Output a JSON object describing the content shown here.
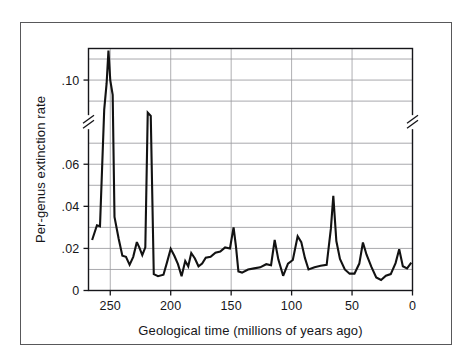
{
  "figure": {
    "background_color": "#ffffff",
    "frame_color": "#58585a",
    "line_color": "#121212",
    "grid_color": "#9a9a9e",
    "axis_color": "#16161a"
  },
  "chart_data": {
    "type": "line",
    "title": "",
    "subtitle": "",
    "xlabel": "Geological time (millions of years ago)",
    "ylabel": "Per-genus extinction rate",
    "xlim": [
      268,
      0
    ],
    "ylim": [
      0,
      0.115
    ],
    "x_reversed": true,
    "grid": true,
    "grid_axis": "y",
    "legend": "none",
    "xticks": [
      250,
      200,
      150,
      100,
      50,
      0
    ],
    "xtick_labels": [
      "250",
      "200",
      "150",
      "100",
      "50",
      "0"
    ],
    "yticks": [
      0,
      0.02,
      0.04,
      0.06,
      0.1
    ],
    "ytick_labels": [
      "0",
      ".02",
      ".04",
      ".06",
      ".10"
    ],
    "y_gridlines": [
      0.01,
      0.02,
      0.03,
      0.04,
      0.05,
      0.06,
      0.07,
      0.09,
      0.1,
      0.11
    ],
    "axis_break": {
      "present": true,
      "axis": "y",
      "between": [
        0.07,
        0.09
      ],
      "marker": "double-slash",
      "sides": [
        "left",
        "right"
      ]
    },
    "series": [
      {
        "name": "Per-genus extinction rate",
        "color": "#121212",
        "points": [
          [
            265.0,
            0.024
          ],
          [
            261.0,
            0.031
          ],
          [
            258.5,
            0.0305
          ],
          [
            255.0,
            0.086
          ],
          [
            253.0,
            0.0985
          ],
          [
            251.5,
            0.114
          ],
          [
            250.0,
            0.1
          ],
          [
            248.0,
            0.093
          ],
          [
            246.5,
            0.035
          ],
          [
            243.0,
            0.0245
          ],
          [
            240.0,
            0.0165
          ],
          [
            237.0,
            0.016
          ],
          [
            234.0,
            0.0122
          ],
          [
            231.0,
            0.016
          ],
          [
            228.0,
            0.023
          ],
          [
            226.0,
            0.0205
          ],
          [
            223.5,
            0.0168
          ],
          [
            221.0,
            0.0205
          ],
          [
            219.0,
            0.0845
          ],
          [
            216.5,
            0.083
          ],
          [
            214.0,
            0.0078
          ],
          [
            210.5,
            0.0068
          ],
          [
            206.0,
            0.0075
          ],
          [
            203.0,
            0.0135
          ],
          [
            200.0,
            0.0198
          ],
          [
            197.0,
            0.0165
          ],
          [
            194.0,
            0.0125
          ],
          [
            191.0,
            0.0068
          ],
          [
            188.0,
            0.014
          ],
          [
            185.5,
            0.0115
          ],
          [
            183.0,
            0.0178
          ],
          [
            180.0,
            0.0152
          ],
          [
            177.0,
            0.0115
          ],
          [
            174.0,
            0.0128
          ],
          [
            171.0,
            0.0156
          ],
          [
            167.0,
            0.016
          ],
          [
            163.0,
            0.018
          ],
          [
            159.0,
            0.0185
          ],
          [
            155.0,
            0.0205
          ],
          [
            151.0,
            0.02
          ],
          [
            148.0,
            0.03
          ],
          [
            146.0,
            0.0208
          ],
          [
            144.0,
            0.009
          ],
          [
            141.0,
            0.0085
          ],
          [
            136.0,
            0.01
          ],
          [
            131.0,
            0.0105
          ],
          [
            126.0,
            0.011
          ],
          [
            121.0,
            0.0125
          ],
          [
            117.0,
            0.012
          ],
          [
            114.0,
            0.024
          ],
          [
            111.0,
            0.0148
          ],
          [
            107.0,
            0.007
          ],
          [
            103.0,
            0.0128
          ],
          [
            99.0,
            0.0145
          ],
          [
            95.0,
            0.0258
          ],
          [
            92.0,
            0.023
          ],
          [
            89.0,
            0.0155
          ],
          [
            86.0,
            0.01
          ],
          [
            81.0,
            0.011
          ],
          [
            76.0,
            0.0118
          ],
          [
            71.0,
            0.0122
          ],
          [
            67.5,
            0.0295
          ],
          [
            65.5,
            0.045
          ],
          [
            63.0,
            0.0235
          ],
          [
            60.0,
            0.015
          ],
          [
            56.0,
            0.01
          ],
          [
            52.0,
            0.008
          ],
          [
            48.0,
            0.008
          ],
          [
            44.0,
            0.0128
          ],
          [
            41.0,
            0.0228
          ],
          [
            38.0,
            0.017
          ],
          [
            34.0,
            0.0112
          ],
          [
            30.0,
            0.0062
          ],
          [
            26.0,
            0.005
          ],
          [
            22.0,
            0.007
          ],
          [
            18.0,
            0.0078
          ],
          [
            14.0,
            0.013
          ],
          [
            11.0,
            0.0196
          ],
          [
            8.0,
            0.0115
          ],
          [
            4.5,
            0.0105
          ],
          [
            1.0,
            0.0132
          ]
        ]
      }
    ],
    "annotations": []
  }
}
